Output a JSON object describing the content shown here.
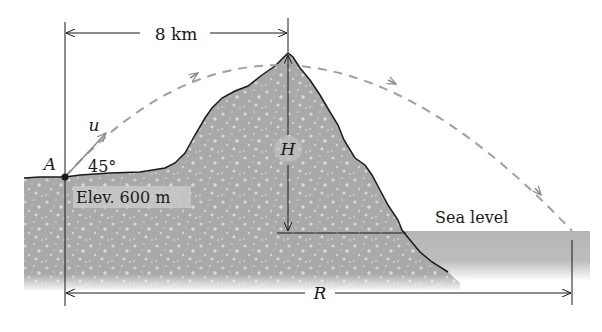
{
  "figure": {
    "type": "projectile-over-mountain",
    "colors": {
      "terrain": "#a9a9a9",
      "terrain_speckle": "#d4d4d4",
      "sea": "#b9b9b9",
      "trajectory": "#a0a0a0",
      "line": "#1a1a1a",
      "label_box": "#c9c9c9"
    }
  },
  "labels": {
    "horizontal_distance": "8 km",
    "point": "A",
    "velocity": "u",
    "angle": "45°",
    "elevation": "Elev. 600 m",
    "height": "H",
    "sea_level": "Sea level",
    "range": "R"
  }
}
